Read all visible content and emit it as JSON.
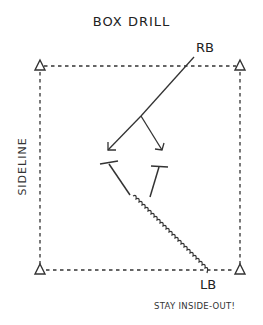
{
  "title": "BOX DRILL",
  "labels": {
    "rb": "RB",
    "lb": "LB",
    "sideline": "SIDELINE",
    "note": "STAY INSIDE-OUT!"
  },
  "elements": {
    "cones": [
      "top-left",
      "top-right",
      "bottom-left",
      "bottom-right"
    ],
    "box": "dashed",
    "rb_route": "line splitting into two arrows",
    "blocks": 2,
    "lb_path": "wavy"
  },
  "colors": {
    "ink": "#222222",
    "background": "#ffffff"
  }
}
